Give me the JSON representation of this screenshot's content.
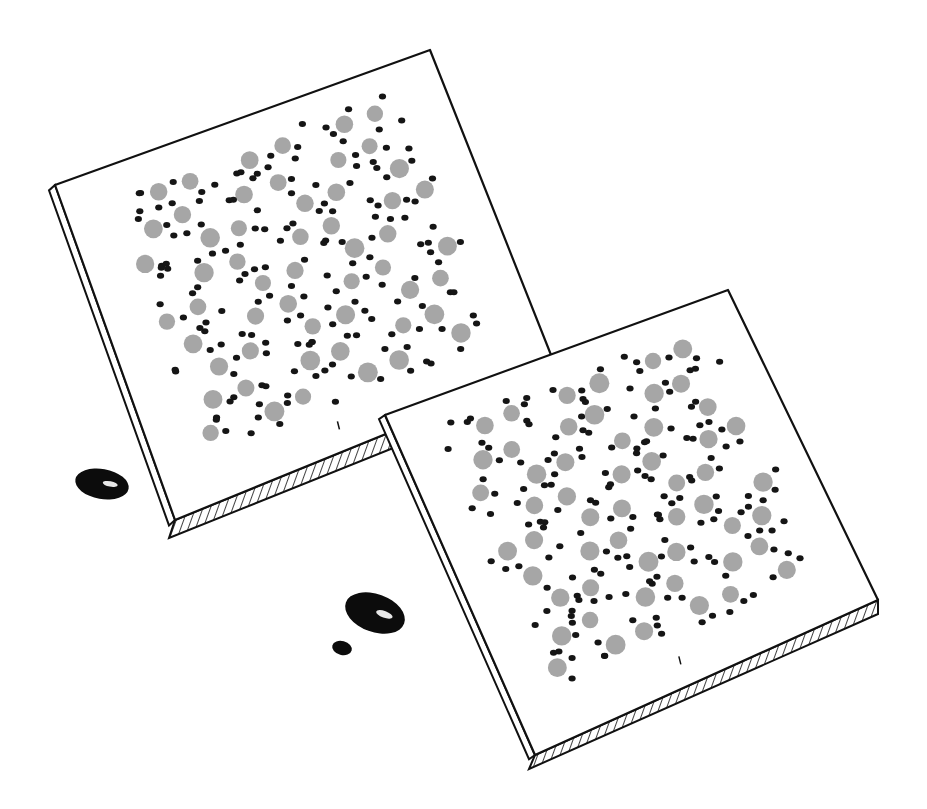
{
  "illustration": {
    "title": "Two crystal lattice slabs with droplets",
    "colors": {
      "background": "#ffffff",
      "ink": "#111111",
      "large_atom": "#a6a6a6",
      "small_atom": "#151515",
      "droplet": "#0c0c0c",
      "highlight": "#e8e8e8"
    },
    "slabs": [
      {
        "name": "back-slab",
        "top_face": [
          [
            55,
            185
          ],
          [
            430,
            50
          ],
          [
            555,
            365
          ],
          [
            175,
            520
          ]
        ],
        "thickness": 18,
        "atom_rows": 9,
        "atom_cols": 9
      },
      {
        "name": "front-slab",
        "top_face": [
          [
            385,
            415
          ],
          [
            728,
            290
          ],
          [
            878,
            600
          ],
          [
            535,
            755
          ]
        ],
        "thickness": 14,
        "atom_rows": 9,
        "atom_cols": 9
      }
    ],
    "droplets": [
      {
        "cx": 102,
        "cy": 484,
        "rx": 27,
        "ry": 15,
        "rot": 10
      },
      {
        "cx": 375,
        "cy": 613,
        "rx": 31,
        "ry": 19,
        "rot": 20
      },
      {
        "cx": 342,
        "cy": 648,
        "rx": 10,
        "ry": 7,
        "rot": 15
      }
    ]
  }
}
